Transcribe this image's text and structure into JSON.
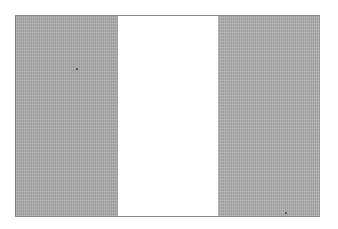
{
  "image": {
    "subject": "vertical tricolor flag (grayscale scan)",
    "bands": [
      {
        "position": "left",
        "color": "#a9a9a9"
      },
      {
        "position": "middle",
        "color": "#ffffff"
      },
      {
        "position": "right",
        "color": "#acacac"
      }
    ],
    "background": "#ffffff"
  }
}
